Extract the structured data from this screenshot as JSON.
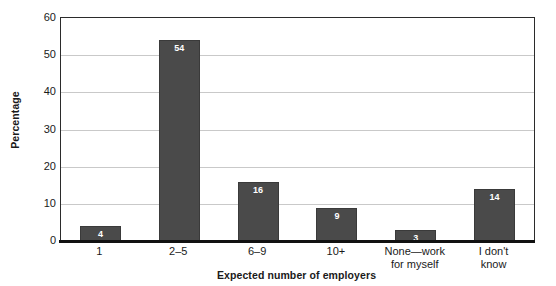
{
  "chart_data": {
    "type": "bar",
    "title": "",
    "subtitle": "",
    "xlabel": "Expected number of employers",
    "ylabel": "Percentage",
    "categories": [
      "1",
      "2–5",
      "6–9",
      "10+",
      "None—work\nfor myself",
      "I don't\nknow"
    ],
    "values": [
      4,
      54,
      16,
      9,
      3,
      14
    ],
    "data_labels": [
      "4",
      "54",
      "16",
      "9",
      "3",
      "14"
    ],
    "ylim": [
      0,
      60
    ],
    "y_ticks": [
      "60",
      "50",
      "40",
      "30",
      "20",
      "10",
      "0"
    ],
    "y_tick_values": [
      60,
      50,
      40,
      30,
      20,
      10,
      0
    ],
    "grid": "horizontal",
    "legend": "none",
    "colors": {
      "bar_fill": "#4a4a4a",
      "bar_border": "#3a3a3a",
      "gridline": "#c9c9c9",
      "axis": "#111111",
      "frame": "#2b2b2b",
      "text": "#1a1a1a",
      "data_label": "#ffffff",
      "background": "#ffffff"
    }
  }
}
